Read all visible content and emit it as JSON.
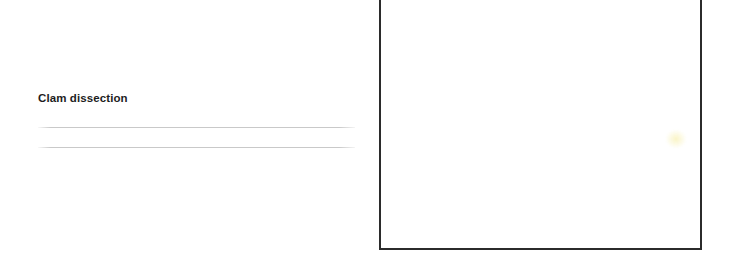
{
  "page": {
    "background_color": "#ffffff",
    "width": 730,
    "height": 268
  },
  "document": {
    "title": "Clam dissection",
    "title_color": "#1d1d1d",
    "ruled_lines": [
      {
        "label": ""
      },
      {
        "label": ""
      }
    ],
    "rule_color": "#c6c6c6"
  },
  "image_frame": {
    "caption": "",
    "border_color": "#2b2b2b",
    "fill_color": "#ffffff",
    "smudge_color": "#f8f0b0"
  }
}
